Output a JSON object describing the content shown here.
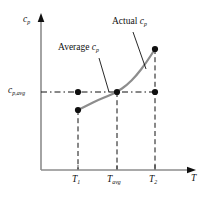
{
  "figure": {
    "background_color": "#ffffff",
    "width": 211,
    "height": 198
  },
  "axes": {
    "y_axis_label": "c",
    "y_axis_label_sub": "p",
    "x_axis_label": "T",
    "origin_x": 41,
    "origin_y": 170,
    "y_top": 14,
    "x_right": 195,
    "axis_color": "#8d8d8d",
    "arrow_color": "#101010"
  },
  "y_tick": {
    "label_main": "c",
    "label_sub": "p,avg",
    "y_pixel": 92
  },
  "x_ticks": [
    {
      "label_main": "T",
      "label_sub": "1",
      "x_pixel": 78
    },
    {
      "label_main": "T",
      "label_sub": "avg",
      "x_pixel": 117
    },
    {
      "label_main": "T",
      "label_sub": "2",
      "x_pixel": 155
    }
  ],
  "annotations": [
    {
      "id": "actual-cp",
      "text_main": "Actual ",
      "text_italic": "c",
      "text_sub": "p",
      "label_x": 112,
      "label_y": 22,
      "leader_from_x": 133,
      "leader_from_y": 32,
      "leader_to_x": 146,
      "leader_to_y": 69
    },
    {
      "id": "average-cp",
      "text_main": "Average ",
      "text_italic": "c",
      "text_sub": "p",
      "label_x": 62,
      "label_y": 48,
      "leader_from_x": 99,
      "leader_from_y": 58,
      "leader_to_x": 109,
      "leader_to_y": 92
    }
  ],
  "dashed_style": {
    "color": "#101010",
    "dash_pattern": "5,3",
    "width": 1
  },
  "chart_data": {
    "type": "line",
    "title": "",
    "xlabel": "T",
    "ylabel": "c_p",
    "grid": false,
    "legend": "none",
    "xlim": [
      41,
      195
    ],
    "ylim": [
      170,
      14
    ],
    "curve": {
      "name": "Actual c_p",
      "color": "#8d8d8d",
      "width": 2.2,
      "points": [
        {
          "x": 78,
          "y": 110
        },
        {
          "x": 88,
          "y": 105
        },
        {
          "x": 98,
          "y": 100
        },
        {
          "x": 108,
          "y": 96
        },
        {
          "x": 117,
          "y": 92
        },
        {
          "x": 127,
          "y": 85
        },
        {
          "x": 136,
          "y": 76
        },
        {
          "x": 146,
          "y": 63
        },
        {
          "x": 155,
          "y": 49
        }
      ]
    },
    "average_line": {
      "name": "Average c_p",
      "y": 92,
      "x_start": 41,
      "x_end": 155
    },
    "markers": [
      {
        "id": "cp-at-T1-curve",
        "x": 78,
        "y": 110,
        "on": "curve"
      },
      {
        "id": "cpavg-at-T1",
        "x": 78,
        "y": 92,
        "on": "average"
      },
      {
        "id": "cpavg-at-Tavg",
        "x": 117,
        "y": 92,
        "on": "both"
      },
      {
        "id": "cpavg-at-T2",
        "x": 155,
        "y": 92,
        "on": "average"
      },
      {
        "id": "cp-at-T2-curve",
        "x": 155,
        "y": 49,
        "on": "curve"
      }
    ],
    "marker_color": "#101010",
    "marker_radius": 3.1,
    "vertical_dashes": [
      {
        "x": 78,
        "y_top": 110,
        "y_bottom": 170
      },
      {
        "x": 117,
        "y_top": 92,
        "y_bottom": 170
      },
      {
        "x": 155,
        "y_top": 49,
        "y_bottom": 170
      }
    ]
  }
}
